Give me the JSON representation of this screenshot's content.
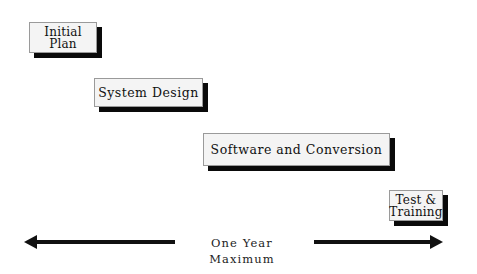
{
  "diagram": {
    "type": "project-timeline",
    "phases": [
      {
        "id": "initial",
        "label": "Initial\nPlan"
      },
      {
        "id": "design",
        "label": "System Design"
      },
      {
        "id": "software",
        "label": "Software and Conversion"
      },
      {
        "id": "test",
        "label": "Test &\nTraining"
      }
    ],
    "timeline": {
      "label": "One Year Maximum",
      "direction": "bidirectional"
    },
    "colors": {
      "box_fill": "#f4f4f4",
      "box_border": "#9a9a9a",
      "shadow": "#0a0a0a",
      "arrow": "#111111",
      "background": "#ffffff"
    }
  }
}
